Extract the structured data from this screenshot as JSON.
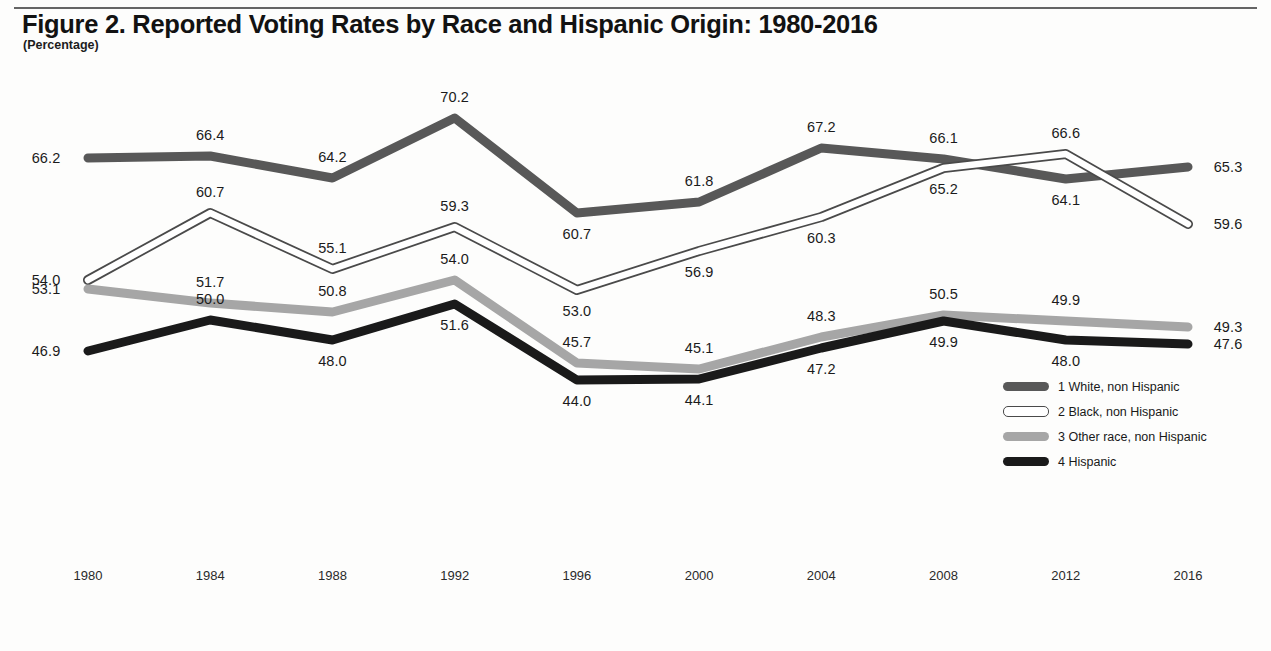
{
  "figure": {
    "title": "Figure 2. Reported Voting Rates by Race and Hispanic Origin: 1980-2016",
    "subtitle": "(Percentage)"
  },
  "legend": {
    "items": [
      {
        "label": "1 White, non Hispanic",
        "swatch": "line-swatch-dark-gray",
        "color": "#585858"
      },
      {
        "label": "2 Black, non Hispanic",
        "swatch": "line-swatch-hollow",
        "color": "#ffffff"
      },
      {
        "label": "3 Other race, non Hispanic",
        "swatch": "line-swatch-light-gray",
        "color": "#a6a6a6"
      },
      {
        "label": "4 Hispanic",
        "swatch": "line-swatch-black",
        "color": "#1a1a1a"
      }
    ]
  },
  "chart_data": {
    "type": "line",
    "title": "Figure 2. Reported Voting Rates by Race and Hispanic Origin: 1980-2016",
    "subtitle": "(Percentage)",
    "xlabel": "",
    "ylabel": "Percentage",
    "categories": [
      1980,
      1984,
      1988,
      1992,
      1996,
      2000,
      2004,
      2008,
      2012,
      2016
    ],
    "tick_labels": [
      "1980",
      "1984",
      "1988",
      "1992",
      "1996",
      "2000",
      "2004",
      "2008",
      "2012",
      "2016"
    ],
    "ylim": [
      40,
      72
    ],
    "grid": false,
    "legend_position": "inside-right",
    "data_labels": true,
    "series": [
      {
        "name": "1 White, non Hispanic",
        "color": "#585858",
        "style": "solid-thick",
        "values": [
          66.2,
          66.4,
          64.2,
          70.2,
          60.7,
          61.8,
          67.2,
          66.1,
          64.1,
          65.3
        ],
        "labels": [
          "66.2",
          "66.4",
          "64.2",
          "70.2",
          "60.7",
          "61.8",
          "67.2",
          "66.1",
          "64.1",
          "65.3"
        ]
      },
      {
        "name": "2 Black, non Hispanic",
        "color": "#ffffff",
        "style": "hollow-outline",
        "values": [
          54.0,
          60.7,
          55.1,
          59.3,
          53.0,
          56.9,
          60.3,
          65.2,
          66.6,
          59.6
        ],
        "labels": [
          "54.0",
          "60.7",
          "55.1",
          "59.3",
          "53.0",
          "56.9",
          "60.3",
          "65.2",
          "66.6",
          "59.6"
        ]
      },
      {
        "name": "3 Other race, non Hispanic",
        "color": "#a6a6a6",
        "style": "solid-thick",
        "values": [
          53.1,
          51.7,
          50.8,
          54.0,
          45.7,
          45.1,
          48.3,
          50.5,
          49.9,
          49.3
        ],
        "labels": [
          "53.1",
          "51.7",
          "50.8",
          "54.0",
          "45.7",
          "45.1",
          "48.3",
          "50.5",
          "49.9",
          "49.3"
        ]
      },
      {
        "name": "4 Hispanic",
        "color": "#1a1a1a",
        "style": "solid-thick",
        "values": [
          46.9,
          50.0,
          48.0,
          51.6,
          44.0,
          44.1,
          47.2,
          49.9,
          48.0,
          47.6
        ],
        "labels": [
          "46.9",
          "50.0",
          "48.0",
          "51.6",
          "44.0",
          "44.1",
          "47.2",
          "49.9",
          "48.0",
          "47.6"
        ]
      }
    ],
    "label_offsets": {
      "1 White, non Hispanic": [
        "left",
        "above",
        "above",
        "above",
        "below",
        "above",
        "above",
        "above",
        "below",
        "right"
      ],
      "2 Black, non Hispanic": [
        "left",
        "above",
        "above",
        "above",
        "below",
        "below",
        "below",
        "below",
        "above",
        "right"
      ],
      "3 Other race, non Hispanic": [
        "left",
        "above",
        "above",
        "above",
        "above",
        "above",
        "above",
        "above",
        "above",
        "right"
      ],
      "4 Hispanic": [
        "left",
        "above",
        "below",
        "below",
        "below",
        "below",
        "below",
        "below",
        "below",
        "right"
      ]
    }
  }
}
